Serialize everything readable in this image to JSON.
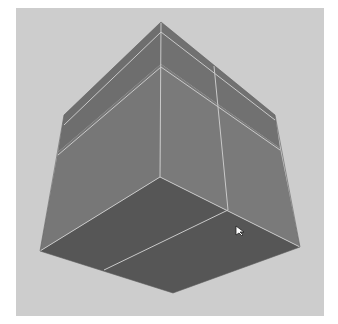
{
  "viewport": {
    "background": "#cdcdcd",
    "frame": "#ffffff"
  },
  "model": {
    "name": "cube",
    "faces": {
      "left_color": "#767676",
      "right_color": "#7a7a7a",
      "top_left_color": "#6e6e6e",
      "top_right_color": "#717171",
      "bottom_color": "#565656"
    },
    "edge_color": "#c9c9c9",
    "edge_loops": 3
  },
  "cursor": {
    "icon": "arrow-cursor-icon",
    "x": 238,
    "y": 232
  }
}
